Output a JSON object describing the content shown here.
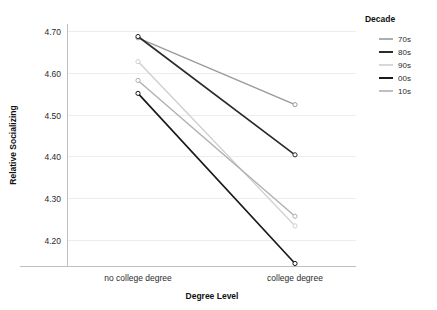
{
  "chart_data": {
    "type": "line",
    "title": "",
    "xlabel": "Degree Level",
    "ylabel": "Relative Socializing",
    "categories": [
      "no college degree",
      "college degree"
    ],
    "x": [
      0,
      1
    ],
    "xtick_labels": [
      "no college degree",
      "college degree"
    ],
    "ytick_labels": [
      "4.20",
      "4.30",
      "4.40",
      "4.50",
      "4.60",
      "4.70"
    ],
    "yticks": [
      4.2,
      4.3,
      4.4,
      4.5,
      4.6,
      4.7
    ],
    "ylim": [
      4.125,
      4.735
    ],
    "grid": "horizontal",
    "legend_position": "right",
    "legend_title": "Decade",
    "series": [
      {
        "name": "70s",
        "values": [
          4.685,
          4.525
        ],
        "color": "#9a9a9a"
      },
      {
        "name": "80s",
        "values": [
          4.688,
          4.405
        ],
        "color": "#2b2b2b"
      },
      {
        "name": "90s",
        "values": [
          4.628,
          4.235
        ],
        "color": "#cfcfcf"
      },
      {
        "name": "00s",
        "values": [
          4.552,
          4.145
        ],
        "color": "#1a1a1a"
      },
      {
        "name": "10s",
        "values": [
          4.583,
          4.258
        ],
        "color": "#b0b0b0"
      }
    ]
  },
  "legend": {
    "title": "Decade",
    "items": [
      {
        "label": "70s",
        "color": "#9a9a9a"
      },
      {
        "label": "80s",
        "color": "#2b2b2b"
      },
      {
        "label": "90s",
        "color": "#cfcfcf"
      },
      {
        "label": "00s",
        "color": "#1a1a1a"
      },
      {
        "label": "10s",
        "color": "#b0b0b0"
      }
    ]
  },
  "axes": {
    "x_title": "Degree Level",
    "y_title": "Relative Socializing",
    "x_labels": [
      "no college degree",
      "college degree"
    ],
    "y_labels": [
      "4.70",
      "4.60",
      "4.50",
      "4.40",
      "4.30",
      "4.20"
    ]
  }
}
